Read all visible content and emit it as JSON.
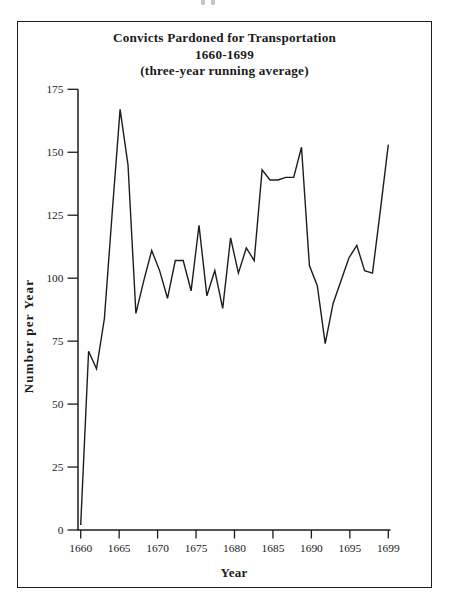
{
  "chart_data": {
    "type": "line",
    "title": "Convicts Pardoned for Transportation",
    "subtitle": "1660-1699",
    "note": "(three-year running average)",
    "xlabel": "Year",
    "ylabel": "Number per Year",
    "x": [
      1660,
      1661,
      1662,
      1663,
      1664,
      1665,
      1666,
      1667,
      1668,
      1669,
      1670,
      1671,
      1672,
      1673,
      1674,
      1675,
      1676,
      1677,
      1678,
      1679,
      1680,
      1681,
      1682,
      1683,
      1684,
      1685,
      1686,
      1687,
      1688,
      1689,
      1690,
      1691,
      1692,
      1693,
      1694,
      1695,
      1696,
      1697,
      1698,
      1699
    ],
    "values": [
      2,
      71,
      64,
      84,
      126,
      167,
      145,
      86,
      99,
      111,
      103,
      92,
      107,
      107,
      95,
      121,
      93,
      103,
      88,
      116,
      102,
      112,
      107,
      143,
      139,
      139,
      140,
      140,
      152,
      105,
      97,
      74,
      90,
      99,
      108,
      113,
      103,
      102,
      127,
      153
    ],
    "ylim": [
      0,
      175
    ],
    "yticks": [
      0,
      25,
      50,
      75,
      100,
      125,
      150,
      175
    ],
    "xtick_labels": [
      "1660",
      "1665",
      "1670",
      "1675",
      "1680",
      "1685",
      "1690",
      "1695",
      "1699"
    ],
    "grid": false,
    "legend": "none",
    "ink_color": "#1c1c1c",
    "background": "#fefefe"
  }
}
